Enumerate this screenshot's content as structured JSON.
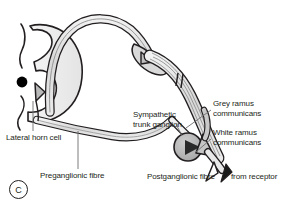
{
  "figure": {
    "panel_letter": "C",
    "background": "#ffffff",
    "ink_color": "#231f20",
    "grey_matter_fill": "#ececec",
    "nerve_fill": "#dedede",
    "ganglion_fill": "#b5b5b5",
    "cell_body_color": "#000000"
  },
  "labels": {
    "lateral_horn_cell": "Lateral horn cell",
    "preganglionic_fibre": "Preganglionic fibre",
    "sympathetic_trunk_ganglion_line1": "Sympathetic",
    "sympathetic_trunk_ganglion_line2": "trunk ganglion",
    "grey_ramus_line1": "Grey ramus",
    "grey_ramus_line2": "communicans",
    "white_ramus_line1": "White ramus",
    "white_ramus_line2": "communicans",
    "postganglionic_fibre": "Postganglionic fibre",
    "from_receptor": "from receptor"
  },
  "structures": {
    "spinal_cord": "spinal-cord-cross-section",
    "grey_matter": "grey-matter-butterfly",
    "lateral_horn_cell_body": "black-dot-neuron-soma",
    "dorsal_root": "dorsal-root-arc",
    "dorsal_root_ganglion": "dorsal-root-ganglion-with-triangular-cell",
    "ventral_root": "ventral-root",
    "spinal_nerve": "spinal-nerve-trunk",
    "sympathetic_ganglion": "sympathetic-trunk-ganglion-sphere",
    "synapse_cell": "triangular-postganglionic-neuron",
    "white_ramus": "white-ramus-communicans-branch",
    "grey_ramus": "grey-ramus-communicans-branch",
    "receptor_arrow": "afferent-arrow-from-receptor",
    "efferent_arrow": "postganglionic-efferent-arrow"
  }
}
